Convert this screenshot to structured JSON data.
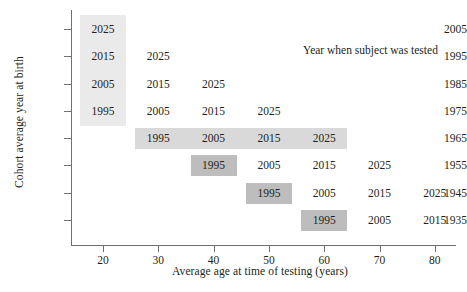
{
  "chart_data": {
    "type": "table",
    "title": "",
    "xlabel": "Average age at time of testing (years)",
    "ylabel": "Cohort average year at birth",
    "annotation": "Year when subject was tested",
    "xlim": [
      14,
      84
    ],
    "xticks": [
      20,
      30,
      40,
      50,
      60,
      70,
      80
    ],
    "xtick_labels": [
      "20",
      "30",
      "40",
      "50",
      "60",
      "70",
      "80"
    ],
    "yticks": [
      2005,
      1995,
      1985,
      1975,
      1965,
      1955,
      1945,
      1935
    ],
    "ytick_labels": [
      "2005",
      "1995",
      "1985",
      "1975",
      "1965",
      "1955",
      "1945",
      "1935"
    ],
    "grid": false,
    "legend": "none",
    "colors": {
      "band_column_light": "#eaeaea",
      "band_row_mid": "#d9d9d9",
      "band_cell_dark": "#bdbdbd",
      "axis": "#6f6f6f",
      "text": "#231f20",
      "background": "#ffffff"
    },
    "rows": [
      {
        "cohort": "2005",
        "cells": [
          {
            "age": 20,
            "test_year": "2025",
            "highlight": "column-light"
          }
        ]
      },
      {
        "cohort": "1995",
        "cells": [
          {
            "age": 20,
            "test_year": "2015",
            "highlight": "column-light"
          },
          {
            "age": 30,
            "test_year": "2025",
            "highlight": "none"
          }
        ]
      },
      {
        "cohort": "1985",
        "cells": [
          {
            "age": 20,
            "test_year": "2005",
            "highlight": "column-light"
          },
          {
            "age": 30,
            "test_year": "2015",
            "highlight": "none"
          },
          {
            "age": 40,
            "test_year": "2025",
            "highlight": "none"
          }
        ]
      },
      {
        "cohort": "1975",
        "cells": [
          {
            "age": 20,
            "test_year": "1995",
            "highlight": "column-light"
          },
          {
            "age": 30,
            "test_year": "2005",
            "highlight": "none"
          },
          {
            "age": 40,
            "test_year": "2015",
            "highlight": "none"
          },
          {
            "age": 50,
            "test_year": "2025",
            "highlight": "none"
          }
        ]
      },
      {
        "cohort": "1965",
        "cells": [
          {
            "age": 30,
            "test_year": "1995",
            "highlight": "row-mid"
          },
          {
            "age": 40,
            "test_year": "2005",
            "highlight": "row-mid"
          },
          {
            "age": 50,
            "test_year": "2015",
            "highlight": "row-mid"
          },
          {
            "age": 60,
            "test_year": "2025",
            "highlight": "row-mid"
          }
        ]
      },
      {
        "cohort": "1955",
        "cells": [
          {
            "age": 40,
            "test_year": "1995",
            "highlight": "cell-dark"
          },
          {
            "age": 50,
            "test_year": "2005",
            "highlight": "none"
          },
          {
            "age": 60,
            "test_year": "2015",
            "highlight": "none"
          },
          {
            "age": 70,
            "test_year": "2025",
            "highlight": "none"
          }
        ]
      },
      {
        "cohort": "1945",
        "cells": [
          {
            "age": 50,
            "test_year": "1995",
            "highlight": "cell-dark"
          },
          {
            "age": 60,
            "test_year": "2005",
            "highlight": "none"
          },
          {
            "age": 70,
            "test_year": "2015",
            "highlight": "none"
          },
          {
            "age": 80,
            "test_year": "2025",
            "highlight": "none"
          }
        ]
      },
      {
        "cohort": "1935",
        "cells": [
          {
            "age": 60,
            "test_year": "1995",
            "highlight": "cell-dark"
          },
          {
            "age": 70,
            "test_year": "2005",
            "highlight": "none"
          },
          {
            "age": 80,
            "test_year": "2015",
            "highlight": "none"
          }
        ]
      }
    ]
  }
}
